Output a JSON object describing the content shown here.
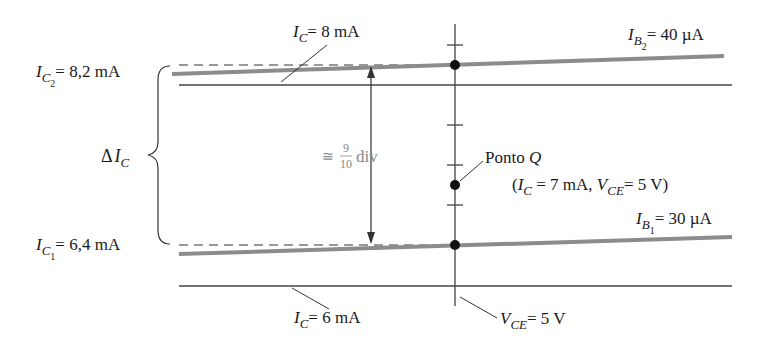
{
  "figure": {
    "labels": {
      "ic2_var": "I",
      "ic2_sub": "C",
      "ic2_sub2": "2",
      "ic2_value": "= 8,2 mA",
      "ic1_var": "I",
      "ic1_sub": "C",
      "ic1_sub2": "1",
      "ic1_value": "= 6,4 mA",
      "delta_ic_prefix": "Δ",
      "delta_ic_var": "I",
      "delta_ic_sub": "C",
      "ic8_var": "I",
      "ic8_sub": "C",
      "ic8_value": "= 8 mA",
      "ic6_var": "I",
      "ic6_sub": "C",
      "ic6_value": "= 6 mA",
      "ib2_var": "I",
      "ib2_sub": "B",
      "ib2_sub2": "2",
      "ib2_value": "= 40 µA",
      "ib1_var": "I",
      "ib1_sub": "B",
      "ib1_sub2": "1",
      "ib1_value": "= 30 µA",
      "ponto_q_text": "Ponto ",
      "ponto_q_letter": "Q",
      "q_coords_open": "(",
      "q_ic_var": "I",
      "q_ic_sub": "C",
      "q_ic_value": " = 7  mA, ",
      "q_vce_var": "V",
      "q_vce_sub": "CE",
      "q_vce_value": "= 5 V)",
      "vce_var": "V",
      "vce_sub": "CE",
      "vce_value": "= 5 V",
      "approx": "≅",
      "frac_num": "9",
      "frac_den": "10",
      "div": "div"
    },
    "colors": {
      "curve": "#8c8c8c",
      "line": "#333333",
      "annotation_gray": "#8a8a8a"
    },
    "quiescent_point": {
      "ic_mA": 7,
      "vce_V": 5
    },
    "curves": [
      {
        "name": "IB2",
        "ib_uA": 40,
        "ic_at_q_mA": 8.2
      },
      {
        "name": "IB1",
        "ib_uA": 30,
        "ic_at_q_mA": 6.4
      }
    ],
    "gridlines_mA": [
      8,
      6
    ]
  }
}
